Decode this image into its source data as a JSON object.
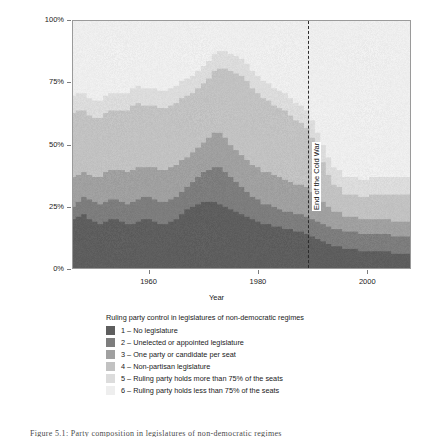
{
  "figure": {
    "caption": "Figure 5.1:  Party composition in legislatures of non-democratic regimes"
  },
  "axes": {
    "y_title": "Proportion of non-democratic regimes",
    "x_title": "Year",
    "y_ticks": [
      "0%",
      "25%",
      "50%",
      "75%",
      "100%"
    ],
    "x_ticks": [
      "1960",
      "1980",
      "2000"
    ]
  },
  "annotation": {
    "cold_war_label": "End of the Cold War",
    "cold_war_year": 1989
  },
  "legend": {
    "title": "Ruling party control in legislatures of non-democratic regimes",
    "items": [
      {
        "key": "1",
        "label": "1 – No legislature",
        "color": "#5e5e5e"
      },
      {
        "key": "2",
        "label": "2 – Unelected or appointed legislature",
        "color": "#7d7d7d"
      },
      {
        "key": "3",
        "label": "3 – One party or candidate per seat",
        "color": "#a0a0a0"
      },
      {
        "key": "4",
        "label": "4 – Non-partisan legislature",
        "color": "#c2c2c2"
      },
      {
        "key": "5",
        "label": "5 – Ruling party holds more than 75% of the seats",
        "color": "#dcdcdc"
      },
      {
        "key": "6",
        "label": "6 – Ruling party holds less than 75% of the seats",
        "color": "#eeeeee"
      }
    ]
  },
  "chart_data": {
    "type": "area",
    "title": "",
    "xlabel": "Year",
    "ylabel": "Proportion of non-democratic regimes",
    "xlim": [
      1946,
      2008
    ],
    "ylim": [
      0,
      100
    ],
    "grid": false,
    "legend_position": "below",
    "stacked": true,
    "stack_order": [
      "1",
      "2",
      "3",
      "4",
      "5",
      "6"
    ],
    "colors": [
      "#5e5e5e",
      "#7d7d7d",
      "#a0a0a0",
      "#c2c2c2",
      "#dcdcdc",
      "#eeeeee"
    ],
    "annotations": [
      {
        "type": "vline",
        "x": 1989,
        "label": "End of the Cold War",
        "style": "dashed"
      }
    ],
    "x": [
      1946,
      1947,
      1948,
      1949,
      1950,
      1951,
      1952,
      1953,
      1954,
      1955,
      1956,
      1957,
      1958,
      1959,
      1960,
      1961,
      1962,
      1963,
      1964,
      1965,
      1966,
      1967,
      1968,
      1969,
      1970,
      1971,
      1972,
      1973,
      1974,
      1975,
      1976,
      1977,
      1978,
      1979,
      1980,
      1981,
      1982,
      1983,
      1984,
      1985,
      1986,
      1987,
      1988,
      1989,
      1990,
      1991,
      1992,
      1993,
      1994,
      1995,
      1996,
      1997,
      1998,
      1999,
      2000,
      2001,
      2002,
      2003,
      2004,
      2005,
      2006,
      2007,
      2008
    ],
    "series": [
      {
        "name": "1 – No legislature",
        "values": [
          20,
          21,
          22,
          20,
          19,
          18,
          19,
          20,
          20,
          19,
          18,
          18,
          19,
          20,
          20,
          19,
          18,
          18,
          19,
          20,
          22,
          24,
          25,
          26,
          27,
          27,
          27,
          26,
          25,
          24,
          23,
          22,
          21,
          20,
          19,
          18,
          18,
          17,
          17,
          16,
          16,
          15,
          15,
          14,
          13,
          12,
          11,
          10,
          9,
          9,
          8,
          8,
          8,
          7,
          7,
          7,
          7,
          7,
          7,
          6,
          6,
          6,
          6
        ]
      },
      {
        "name": "2 – Unelected or appointed legislature",
        "values": [
          5,
          6,
          7,
          8,
          8,
          8,
          8,
          8,
          8,
          8,
          8,
          9,
          9,
          9,
          9,
          9,
          9,
          9,
          9,
          9,
          9,
          9,
          10,
          11,
          12,
          13,
          14,
          15,
          14,
          13,
          12,
          11,
          10,
          9,
          9,
          8,
          8,
          8,
          7,
          7,
          7,
          7,
          7,
          7,
          7,
          7,
          7,
          7,
          7,
          7,
          7,
          7,
          7,
          7,
          7,
          7,
          7,
          7,
          7,
          7,
          7,
          7,
          7
        ]
      },
      {
        "name": "3 – One party or candidate per seat",
        "values": [
          12,
          11,
          10,
          10,
          10,
          11,
          12,
          12,
          12,
          13,
          13,
          13,
          13,
          12,
          12,
          13,
          13,
          13,
          13,
          13,
          13,
          12,
          12,
          12,
          12,
          13,
          14,
          14,
          14,
          13,
          13,
          13,
          13,
          13,
          13,
          13,
          13,
          13,
          13,
          13,
          12,
          12,
          12,
          12,
          11,
          10,
          9,
          8,
          7,
          7,
          6,
          6,
          6,
          6,
          6,
          6,
          6,
          6,
          6,
          6,
          6,
          6,
          6
        ]
      },
      {
        "name": "4 – Non-partisan legislature",
        "values": [
          26,
          26,
          25,
          24,
          24,
          24,
          24,
          24,
          24,
          24,
          25,
          26,
          26,
          25,
          25,
          25,
          25,
          25,
          25,
          25,
          25,
          25,
          24,
          24,
          24,
          24,
          25,
          26,
          28,
          30,
          31,
          32,
          32,
          31,
          30,
          30,
          29,
          28,
          28,
          28,
          27,
          26,
          25,
          24,
          22,
          19,
          16,
          13,
          11,
          10,
          9,
          9,
          9,
          9,
          9,
          10,
          10,
          10,
          10,
          11,
          11,
          11,
          11
        ]
      },
      {
        "name": "5 – Ruling party holds more than 75% of the seats",
        "values": [
          7,
          7,
          7,
          7,
          7,
          7,
          7,
          7,
          7,
          7,
          7,
          7,
          7,
          7,
          7,
          7,
          7,
          7,
          7,
          7,
          7,
          7,
          7,
          7,
          7,
          7,
          7,
          7,
          7,
          7,
          7,
          7,
          7,
          7,
          7,
          7,
          7,
          7,
          7,
          7,
          7,
          7,
          7,
          7,
          7,
          7,
          7,
          7,
          7,
          7,
          7,
          7,
          7,
          7,
          7,
          7,
          7,
          7,
          7,
          7,
          7,
          7,
          7
        ]
      },
      {
        "name": "6 – Ruling party holds less than 75% of the seats",
        "values": [
          30,
          29,
          29,
          31,
          32,
          32,
          30,
          29,
          29,
          29,
          29,
          27,
          26,
          27,
          27,
          27,
          28,
          28,
          27,
          26,
          24,
          23,
          22,
          20,
          18,
          16,
          13,
          12,
          12,
          13,
          14,
          15,
          17,
          20,
          22,
          24,
          25,
          27,
          28,
          29,
          31,
          33,
          34,
          36,
          40,
          45,
          50,
          55,
          59,
          60,
          63,
          63,
          63,
          64,
          64,
          63,
          63,
          63,
          63,
          63,
          63,
          63,
          63
        ]
      }
    ]
  }
}
